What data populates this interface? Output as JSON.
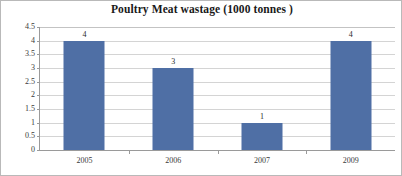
{
  "chart_data": {
    "type": "bar",
    "title": "Poultry Meat wastage (1000 tonnes )",
    "categories": [
      "2005",
      "2006",
      "2007",
      "2009"
    ],
    "values": [
      4,
      3,
      1,
      4
    ],
    "value_labels": [
      "4",
      "3",
      "1",
      "4"
    ],
    "xlabel": "",
    "ylabel": "",
    "ylim": [
      0,
      4.5
    ],
    "ytick_labels": [
      "4.5",
      "4",
      "3.5",
      "3",
      "2.5",
      "2",
      "1.5",
      "1",
      "0.5",
      "0"
    ],
    "ytick_values": [
      4.5,
      4,
      3.5,
      3,
      2.5,
      2,
      1.5,
      1,
      0.5,
      0
    ],
    "grid": true,
    "grid_orientation": "horizontal",
    "legend": false,
    "legend_position": "none",
    "series": [
      {
        "name": "Poultry Meat wastage",
        "values": [
          4,
          3,
          1,
          4
        ],
        "color": "#4F6FA5"
      }
    ],
    "colors": {
      "bar": "#4F6FA5",
      "gridline": "#D4D4D4",
      "axis": "#9A9A9A",
      "text": "#3A3A3A",
      "title": "#191919",
      "background": "#FFFFFF",
      "border": "#B9B9B9"
    }
  }
}
